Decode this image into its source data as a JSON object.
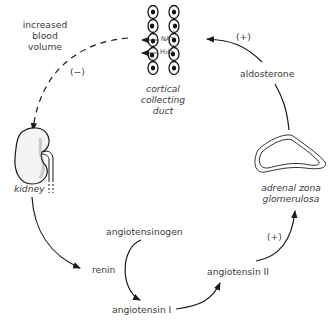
{
  "diagram": {
    "nodes": {
      "blood_volume": [
        "increased",
        "blood",
        "volume"
      ],
      "collecting_duct": [
        "cortical",
        "collecting",
        "duct"
      ],
      "ion_na": "NA⁺",
      "ion_h2o": "H₂O",
      "aldosterone": "aldosterone",
      "adrenal": [
        "adrenal zona",
        "glomerulosa"
      ],
      "kidney": "kidney",
      "renin": "renin",
      "angiotensinogen": "angiotensinogen",
      "angiotensin_i": "angiotensin I",
      "angiotensin_ii": "angiotensin II"
    },
    "edge_labels": {
      "negative_feedback": "(−)",
      "aldosterone_effect": "(+)",
      "angiotensin_ii_effect": "(+)"
    },
    "edges": [
      {
        "from": "collecting_duct",
        "to": "kidney",
        "style": "dashed",
        "sign": "negative"
      },
      {
        "from": "kidney",
        "to": "renin",
        "style": "solid"
      },
      {
        "from": "angiotensinogen",
        "to": "angiotensin_i",
        "style": "solid"
      },
      {
        "from": "angiotensin_i",
        "to": "angiotensin_ii",
        "style": "solid"
      },
      {
        "from": "angiotensin_ii",
        "to": "adrenal",
        "style": "solid",
        "sign": "positive"
      },
      {
        "from": "adrenal",
        "to": "aldosterone",
        "style": "solid"
      },
      {
        "from": "aldosterone",
        "to": "collecting_duct",
        "style": "solid",
        "sign": "positive"
      }
    ]
  }
}
